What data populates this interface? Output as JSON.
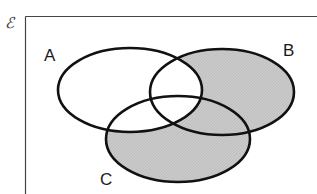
{
  "diagram": {
    "type": "venn",
    "universal_set_symbol": "ℰ",
    "sets": [
      {
        "label": "A",
        "cx": 130,
        "cy": 90,
        "rx": 72,
        "ry": 42
      },
      {
        "label": "B",
        "cx": 222,
        "cy": 92,
        "rx": 72,
        "ry": 43
      },
      {
        "label": "C",
        "cx": 178,
        "cy": 139,
        "rx": 72,
        "ry": 43
      }
    ],
    "shaded_region": "(B ∪ C) ∩ A'",
    "colors": {
      "shade": "#c8c8c8",
      "outline": "#111111",
      "frame": "#444444",
      "background": "#ffffff"
    }
  }
}
